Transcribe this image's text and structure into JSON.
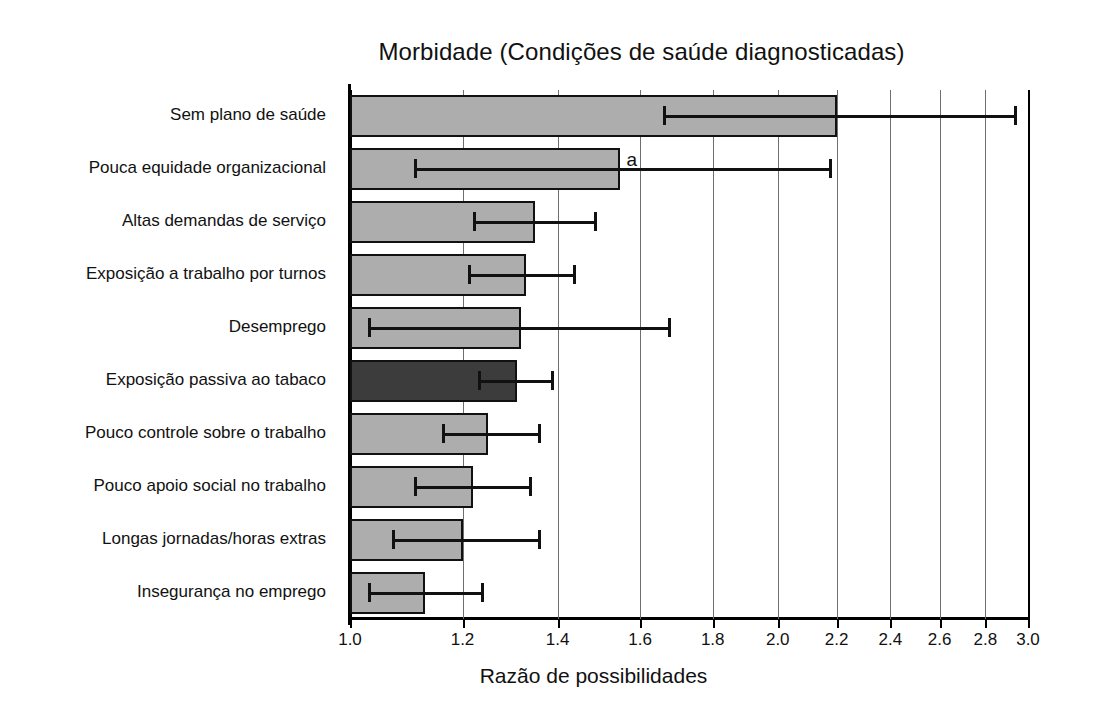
{
  "chart_data": {
    "type": "bar",
    "orientation": "horizontal",
    "title": "Morbidade (Condições de saúde diagnosticadas)",
    "xlabel": "Razão de possibilidades",
    "ylabel": "",
    "xscale": "log",
    "xlim": [
      1.0,
      3.0
    ],
    "grid": true,
    "legend": null,
    "xticks": [
      1.0,
      1.2,
      1.4,
      1.6,
      1.8,
      2.0,
      2.2,
      2.4,
      2.6,
      2.8,
      3.0
    ],
    "xticklabels": [
      "1.0",
      "1.2",
      "1.4",
      "1.6",
      "1.8",
      "2.0",
      "2.2",
      "2.4",
      "2.6",
      "2.8",
      "3.0"
    ],
    "categories": [
      "Sem plano de saúde",
      "Pouca equidade organizacional",
      "Altas demandas de serviço",
      "Exposição a trabalho por turnos",
      "Desemprego",
      "Exposição passiva ao tabaco",
      "Pouco controle sobre o trabalho",
      "Pouco apoio social no trabalho",
      "Longas jornadas/horas extras",
      "Insegurança no emprego"
    ],
    "values": [
      2.2,
      1.55,
      1.35,
      1.33,
      1.32,
      1.31,
      1.25,
      1.22,
      1.2,
      1.13
    ],
    "ci_low": [
      1.66,
      1.11,
      1.22,
      1.21,
      1.03,
      1.23,
      1.16,
      1.11,
      1.07,
      1.03
    ],
    "ci_high": [
      2.94,
      2.18,
      1.49,
      1.44,
      1.68,
      1.39,
      1.36,
      1.34,
      1.36,
      1.24
    ],
    "highlight_index": 5,
    "annotations": [
      {
        "text": "a",
        "category": "Pouca equidade organizacional",
        "value": 1.55
      }
    ],
    "colors": {
      "bar_light": "#adadad",
      "bar_dark": "#3c3c3c",
      "bar_edge": "#111111",
      "grid": "#6f6f6f",
      "axis": "#000000",
      "text": "#111111",
      "background": "#ffffff"
    }
  }
}
